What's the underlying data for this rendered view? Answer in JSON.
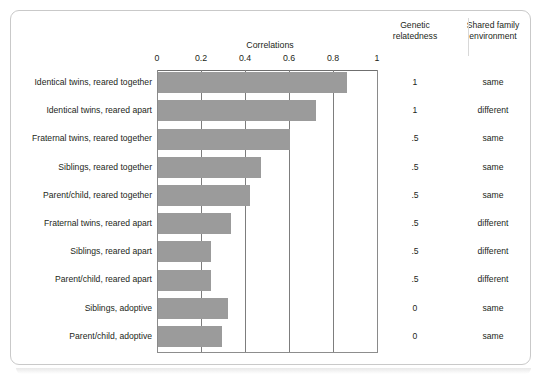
{
  "figure": {
    "bar_color": "#9b9b9b",
    "frame_color": "#c9c9c9",
    "gridline_color": "#7d7d7d"
  },
  "headers": {
    "genetic": {
      "line1": "Genetic",
      "line2": "relatedness"
    },
    "shared": {
      "line1": "Shared family",
      "line2": "environment"
    }
  },
  "axis": {
    "title": "Correlations",
    "ticks": [
      "0",
      "0.2",
      "0.4",
      "0.6",
      "0.8",
      "1"
    ],
    "tick_values": [
      0,
      0.2,
      0.4,
      0.6,
      0.8,
      1
    ]
  },
  "chart_data": {
    "type": "bar",
    "orientation": "horizontal",
    "title": "",
    "xlabel": "Correlations",
    "ylabel": "",
    "xlim": [
      0,
      1
    ],
    "grid": true,
    "legend": "none",
    "categories": [
      "Identical twins, reared together",
      "Identical twins, reared apart",
      "Fraternal twins, reared together",
      "Siblings, reared together",
      "Parent/child, reared together",
      "Fraternal twins, reared apart",
      "Siblings, reared apart",
      "Parent/child, reared apart",
      "Siblings, adoptive",
      "Parent/child, adoptive"
    ],
    "values": [
      0.86,
      0.72,
      0.6,
      0.47,
      0.42,
      0.33,
      0.24,
      0.24,
      0.32,
      0.29
    ],
    "annotations": {
      "genetic_relatedness": [
        "1",
        "1",
        ".5",
        ".5",
        ".5",
        ".5",
        ".5",
        ".5",
        "0",
        "0"
      ],
      "shared_family_environment": [
        "same",
        "different",
        "same",
        "same",
        "same",
        "different",
        "different",
        "different",
        "same",
        "same"
      ]
    }
  },
  "rows": [
    {
      "label": "Identical twins, reared together",
      "value": 0.86,
      "genetic": "1",
      "shared": "same"
    },
    {
      "label": "Identical twins, reared apart",
      "value": 0.72,
      "genetic": "1",
      "shared": "different"
    },
    {
      "label": "Fraternal twins, reared together",
      "value": 0.6,
      "genetic": ".5",
      "shared": "same"
    },
    {
      "label": "Siblings, reared together",
      "value": 0.47,
      "genetic": ".5",
      "shared": "same"
    },
    {
      "label": "Parent/child, reared together",
      "value": 0.42,
      "genetic": ".5",
      "shared": "same"
    },
    {
      "label": "Fraternal twins, reared apart",
      "value": 0.33,
      "genetic": ".5",
      "shared": "different"
    },
    {
      "label": "Siblings, reared apart",
      "value": 0.24,
      "genetic": ".5",
      "shared": "different"
    },
    {
      "label": "Parent/child, reared apart",
      "value": 0.24,
      "genetic": ".5",
      "shared": "different"
    },
    {
      "label": "Siblings, adoptive",
      "value": 0.32,
      "genetic": "0",
      "shared": "same"
    },
    {
      "label": "Parent/child, adoptive",
      "value": 0.29,
      "genetic": "0",
      "shared": "same"
    }
  ]
}
